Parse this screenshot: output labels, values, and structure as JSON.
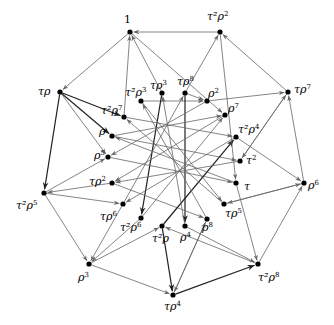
{
  "diagram": {
    "edge_color_thin": "#666666",
    "edge_color_thick": "#222222",
    "node_color": "#000000",
    "nodes": [
      {
        "id": "1",
        "base": "1",
        "exp": "",
        "x": 130,
        "y": 32,
        "lx": 124,
        "ly": 14,
        "ring": "outer"
      },
      {
        "id": "t2r2",
        "base": "τ²ρ",
        "exp": "2",
        "x": 220,
        "y": 32,
        "lx": 207,
        "ly": 11,
        "ring": "outer"
      },
      {
        "id": "tr",
        "base": "τρ",
        "exp": "",
        "x": 60,
        "y": 92,
        "lx": 38,
        "ly": 86,
        "ring": "outer"
      },
      {
        "id": "tr7",
        "base": "τρ",
        "exp": "7",
        "x": 288,
        "y": 92,
        "lx": 294,
        "ly": 84,
        "ring": "outer"
      },
      {
        "id": "t2r5",
        "base": "τ²ρ",
        "exp": "5",
        "x": 44,
        "y": 193,
        "lx": 16,
        "ly": 200,
        "ring": "outer"
      },
      {
        "id": "r6",
        "base": "ρ",
        "exp": "6",
        "x": 304,
        "y": 183,
        "lx": 308,
        "ly": 180,
        "ring": "outer"
      },
      {
        "id": "r3",
        "base": "ρ",
        "exp": "3",
        "x": 89,
        "y": 264,
        "lx": 78,
        "ly": 272,
        "ring": "outer"
      },
      {
        "id": "t2r8",
        "base": "τ²ρ",
        "exp": "8",
        "x": 258,
        "y": 264,
        "lx": 258,
        "ly": 272,
        "ring": "outer"
      },
      {
        "id": "tr4",
        "base": "τρ",
        "exp": "4",
        "x": 173,
        "y": 295,
        "lx": 164,
        "ly": 301,
        "ring": "outer"
      },
      {
        "id": "t2r3",
        "base": "τ²ρ",
        "exp": "3",
        "x": 141,
        "y": 101,
        "lx": 125,
        "ly": 87,
        "ring": "inner"
      },
      {
        "id": "tr3",
        "base": "τρ",
        "exp": "3",
        "x": 162,
        "y": 93,
        "lx": 150,
        "ly": 80,
        "ring": "inner"
      },
      {
        "id": "tr8",
        "base": "τρ",
        "exp": "8",
        "x": 185,
        "y": 93,
        "lx": 177,
        "ly": 76,
        "ring": "inner"
      },
      {
        "id": "r2",
        "base": "ρ",
        "exp": "2",
        "x": 207,
        "y": 101,
        "lx": 208,
        "ly": 88,
        "ring": "inner"
      },
      {
        "id": "t2r7",
        "base": "τ²ρ",
        "exp": "7",
        "x": 124,
        "y": 117,
        "lx": 101,
        "ly": 105,
        "ring": "inner"
      },
      {
        "id": "r7",
        "base": "ρ",
        "exp": "7",
        "x": 225,
        "y": 115,
        "lx": 228,
        "ly": 103,
        "ring": "inner"
      },
      {
        "id": "r",
        "base": "ρ",
        "exp": "",
        "x": 112,
        "y": 136,
        "lx": 99,
        "ly": 126,
        "ring": "inner"
      },
      {
        "id": "t2r4",
        "base": "τ²ρ",
        "exp": "4",
        "x": 236,
        "y": 137,
        "lx": 238,
        "ly": 124,
        "ring": "inner"
      },
      {
        "id": "r5",
        "base": "ρ",
        "exp": "5",
        "x": 108,
        "y": 157,
        "lx": 94,
        "ly": 150,
        "ring": "inner"
      },
      {
        "id": "t2",
        "base": "τ",
        "exp": "2",
        "x": 240,
        "y": 161,
        "lx": 246,
        "ly": 155,
        "ring": "inner"
      },
      {
        "id": "tr2",
        "base": "τρ",
        "exp": "2",
        "x": 112,
        "y": 183,
        "lx": 89,
        "ly": 176,
        "ring": "inner"
      },
      {
        "id": "t",
        "base": "τ",
        "exp": "",
        "x": 236,
        "y": 183,
        "lx": 244,
        "ly": 181,
        "ring": "inner"
      },
      {
        "id": "tr6",
        "base": "τρ",
        "exp": "6",
        "x": 123,
        "y": 204,
        "lx": 100,
        "ly": 211,
        "ring": "inner"
      },
      {
        "id": "tr5",
        "base": "τρ",
        "exp": "5",
        "x": 224,
        "y": 204,
        "lx": 225,
        "ly": 208,
        "ring": "inner"
      },
      {
        "id": "t2r6",
        "base": "τ²ρ",
        "exp": "6",
        "x": 141,
        "y": 218,
        "lx": 120,
        "ly": 222,
        "ring": "inner"
      },
      {
        "id": "r8",
        "base": "ρ",
        "exp": "8",
        "x": 207,
        "y": 219,
        "lx": 202,
        "ly": 222,
        "ring": "inner"
      },
      {
        "id": "t2r",
        "base": "τ²ρ",
        "exp": "",
        "x": 162,
        "y": 226,
        "lx": 152,
        "ly": 233,
        "ring": "inner"
      },
      {
        "id": "r4",
        "base": "ρ",
        "exp": "4",
        "x": 185,
        "y": 226,
        "lx": 180,
        "ly": 232,
        "ring": "inner"
      }
    ],
    "edges": [
      {
        "from": "t2r2",
        "to": "1",
        "w": "thin"
      },
      {
        "from": "tr3",
        "to": "1",
        "w": "thin"
      },
      {
        "from": "1",
        "to": "tr",
        "w": "thin"
      },
      {
        "from": "tr8",
        "to": "t2r2",
        "w": "thin"
      },
      {
        "from": "tr7",
        "to": "t2r2",
        "w": "thin"
      },
      {
        "from": "tr",
        "to": "t2r5",
        "w": "thick"
      },
      {
        "from": "tr",
        "to": "r",
        "w": "thick"
      },
      {
        "from": "t2r5",
        "to": "r3",
        "w": "thin"
      },
      {
        "from": "r3",
        "to": "tr4",
        "w": "thin"
      },
      {
        "from": "tr4",
        "to": "t2r8",
        "w": "thick"
      },
      {
        "from": "t2r8",
        "to": "r6",
        "w": "thin"
      },
      {
        "from": "r6",
        "to": "tr7",
        "w": "thin"
      },
      {
        "from": "r2",
        "to": "tr7",
        "w": "thin"
      },
      {
        "from": "t2r5",
        "to": "r5",
        "w": "thin"
      },
      {
        "from": "t2",
        "to": "tr7",
        "w": "thin"
      },
      {
        "from": "t2r4",
        "to": "r6",
        "w": "thin"
      },
      {
        "from": "tr5",
        "to": "r6",
        "w": "thin"
      },
      {
        "from": "r4",
        "to": "t2r8",
        "w": "thin"
      },
      {
        "from": "t",
        "to": "t2r8",
        "w": "thin"
      },
      {
        "from": "t2r",
        "to": "tr4",
        "w": "thick"
      },
      {
        "from": "r8",
        "to": "tr4",
        "w": "thin"
      },
      {
        "from": "t2r6",
        "to": "r3",
        "w": "thin"
      },
      {
        "from": "tr6",
        "to": "r3",
        "w": "thin"
      },
      {
        "from": "tr2",
        "to": "t2r5",
        "w": "thin"
      },
      {
        "from": "t2r7",
        "to": "1",
        "w": "thin"
      },
      {
        "from": "tr",
        "to": "t2r7",
        "w": "thick"
      },
      {
        "from": "t2r3",
        "to": "r2",
        "w": "thin"
      },
      {
        "from": "tr3",
        "to": "t2r6",
        "w": "thick"
      },
      {
        "from": "tr8",
        "to": "r2",
        "w": "thin"
      },
      {
        "from": "tr8",
        "to": "r4",
        "w": "thick"
      },
      {
        "from": "t2r7",
        "to": "t2r4",
        "w": "thin"
      },
      {
        "from": "t2r3",
        "to": "tr5",
        "w": "thin"
      },
      {
        "from": "r",
        "to": "r7",
        "w": "thin"
      },
      {
        "from": "r2",
        "to": "r5",
        "w": "thin"
      },
      {
        "from": "r7",
        "to": "tr2",
        "w": "thin"
      },
      {
        "from": "r",
        "to": "t2",
        "w": "thin"
      },
      {
        "from": "r5",
        "to": "t",
        "w": "thin"
      },
      {
        "from": "t2r4",
        "to": "tr6",
        "w": "thin"
      },
      {
        "from": "tr2",
        "to": "r8",
        "w": "thin"
      },
      {
        "from": "tr6",
        "to": "tr8",
        "w": "thin"
      },
      {
        "from": "t2r6",
        "to": "r7",
        "w": "thin"
      },
      {
        "from": "t2r",
        "to": "t2r4",
        "w": "thick"
      },
      {
        "from": "r4",
        "to": "tr3",
        "w": "thin"
      },
      {
        "from": "r8",
        "to": "t2r3",
        "w": "thin"
      },
      {
        "from": "tr5",
        "to": "t2r7",
        "w": "thin"
      },
      {
        "from": "t",
        "to": "r",
        "w": "thin"
      },
      {
        "from": "t2",
        "to": "tr2",
        "w": "thin"
      },
      {
        "from": "t2r2",
        "to": "t",
        "w": "thin"
      },
      {
        "from": "t2r5",
        "to": "tr6",
        "w": "thin"
      },
      {
        "from": "tr7",
        "to": "t2",
        "w": "thin"
      },
      {
        "from": "r6",
        "to": "tr5",
        "w": "thin"
      },
      {
        "from": "tr4",
        "to": "r8",
        "w": "thin"
      },
      {
        "from": "r3",
        "to": "t2r",
        "w": "thin"
      },
      {
        "from": "1",
        "to": "r7",
        "w": "thin"
      },
      {
        "from": "tr",
        "to": "r5",
        "w": "thin"
      },
      {
        "from": "t2r8",
        "to": "t2r",
        "w": "thin"
      }
    ]
  }
}
